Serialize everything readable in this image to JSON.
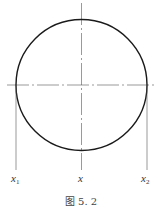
{
  "figure": {
    "caption": "图 5. 2",
    "circle": {
      "cx": 81.5,
      "cy": 85,
      "r": 65.5,
      "stroke": "#1a1a1a"
    },
    "centerlines": {
      "horizontal": {
        "y": 85,
        "x1": 7,
        "x2": 155
      },
      "vertical": {
        "x": 81.5,
        "y1": 3,
        "y2": 170
      }
    },
    "projection_lines": [
      {
        "x": 16,
        "y1": 85,
        "y2": 170
      },
      {
        "x": 147,
        "y1": 85,
        "y2": 170
      }
    ],
    "labels": [
      {
        "name": "x1",
        "base": "x",
        "sub": "1",
        "x": 11,
        "y": 182
      },
      {
        "name": "x",
        "base": "x",
        "sub": "",
        "x": 78,
        "y": 182
      },
      {
        "name": "x2",
        "base": "x",
        "sub": "2",
        "x": 141,
        "y": 182
      }
    ]
  }
}
